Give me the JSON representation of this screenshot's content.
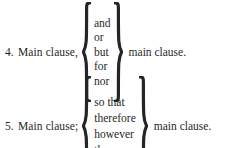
{
  "page": {
    "background_color": "#ffffff",
    "text_color": "#1a1a1a"
  },
  "rules": [
    {
      "number": "4.",
      "first_clause": "Main clause,",
      "options": [
        "and",
        "or",
        "but",
        "for",
        "nor"
      ],
      "second_clause": "main clause.",
      "open_brace": "{",
      "close_brace": "}"
    },
    {
      "number": "5.",
      "first_clause": "Main clause;",
      "options": [
        "so that",
        "therefore",
        "however",
        "then"
      ],
      "second_clause": "main clause.",
      "open_brace": "{",
      "close_brace": "}"
    }
  ]
}
